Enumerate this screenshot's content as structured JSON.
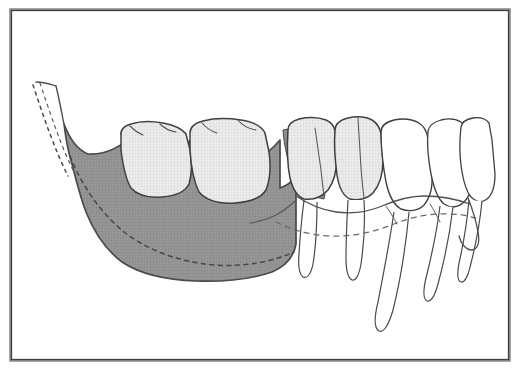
{
  "figure": {
    "title": "Lateral view of mandible with teeth",
    "subject": "mandible",
    "view": "lateral",
    "caption": "",
    "background_color": "#ffffff"
  },
  "frame": {
    "name": "image-border",
    "stroke_color": "#4a4a4a",
    "stroke_width": 1.6,
    "x": 10,
    "y": 9,
    "width": 500,
    "height": 352,
    "inner_stroke_color": "#8a8a8a"
  },
  "palette": {
    "outline": "#3c3c3c",
    "thin_outline": "#5a5a5a",
    "bone_shaded_fill": "#949494",
    "bone_shaded_stroke": "#4a4a4a",
    "tooth_shaded_fill": "#e6e6e6",
    "tooth_outline": "#3f3f3f",
    "tooth_unshaded_fill": "#ffffff",
    "crest_band_fill": "#8f8f8f",
    "dashed_line": "#4a4a4a",
    "background": "#ffffff"
  },
  "regions": [
    {
      "id": "shaded-bone-body",
      "label": "Shaded mandibular body and ramus",
      "fill": "#949494",
      "stroke": "#4a4a4a",
      "stroke_width": 1.6,
      "description": "Dark gray shaded region representing resected or grafted posterior mandible"
    },
    {
      "id": "crest-band",
      "label": "Alveolar crest band",
      "fill": "#8f8f8f",
      "stroke": "#4a4a4a",
      "stroke_width": 1,
      "description": "Thin dark band curving along the first premolar"
    }
  ],
  "dashed_lines": [
    {
      "id": "ramus-original-contour",
      "label": "Original anterior ramus border",
      "dash_pattern": "3 4",
      "stroke": "#4a4a4a",
      "stroke_width": 1.4
    },
    {
      "id": "mandibular-canal",
      "label": "Mandibular canal (inferior alveolar nerve)",
      "dash_pattern": "4 4",
      "stroke": "#4a4a4a",
      "stroke_width": 1.4
    },
    {
      "id": "alveolar-bone-level-anterior",
      "label": "Anterior alveolar bone level",
      "dash_pattern": "4 4",
      "stroke": "#6a6a6a",
      "stroke_width": 1.2
    }
  ],
  "teeth": [
    {
      "id": "tooth-molar-2",
      "name": "Second molar",
      "position": 1,
      "shaded": true,
      "fill": "#e6e6e6",
      "root_visible": false
    },
    {
      "id": "tooth-molar-1",
      "name": "First molar",
      "position": 2,
      "shaded": true,
      "fill": "#e6e6e6",
      "root_visible": false
    },
    {
      "id": "tooth-premolar-2",
      "name": "Second premolar",
      "position": 3,
      "shaded": true,
      "fill": "#e6e6e6",
      "root_visible": true
    },
    {
      "id": "tooth-premolar-1",
      "name": "First premolar",
      "position": 4,
      "shaded": true,
      "fill": "#e6e6e6",
      "root_visible": true
    },
    {
      "id": "tooth-canine",
      "name": "Canine",
      "position": 5,
      "shaded": false,
      "fill": "#ffffff",
      "root_visible": true
    },
    {
      "id": "tooth-incisor-lateral",
      "name": "Lateral incisor",
      "position": 6,
      "shaded": false,
      "fill": "#ffffff",
      "root_visible": true
    },
    {
      "id": "tooth-incisor-central",
      "name": "Central incisor",
      "position": 7,
      "shaded": false,
      "fill": "#ffffff",
      "root_visible": true
    }
  ],
  "annotations": []
}
